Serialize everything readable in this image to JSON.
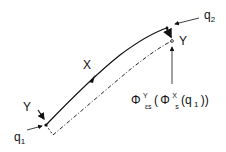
{
  "diagram": {
    "labels": {
      "q1": "q",
      "q1_sub": "1",
      "q2": "q",
      "q2_sub": "2",
      "y_start": "Y",
      "y_end": "Y",
      "x_mid": "X",
      "formula": {
        "phi_outer": "Φ",
        "outer_sup": "Y",
        "outer_sub": "εs",
        "open_paren": "(",
        "phi_inner": "Φ",
        "inner_sup": "X",
        "inner_sub": "s",
        "arg": "(q",
        "arg_sub": "1",
        "close": "))"
      }
    },
    "colors": {
      "stroke": "#111111",
      "background": "#ffffff"
    }
  }
}
